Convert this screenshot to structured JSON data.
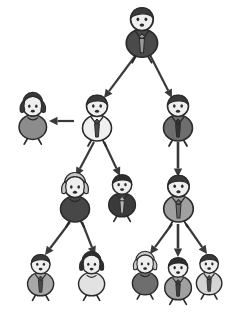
{
  "diagram": {
    "type": "org-chart",
    "background_color": "#ffffff",
    "canvas": {
      "width": 236,
      "height": 318
    },
    "arrow_color": "#3a3a3a",
    "outline_color": "#2b2b2b"
  },
  "palette": {
    "very_dark": "#3b3b3b",
    "dark": "#4a4a4a",
    "mid_dark": "#6e6e6e",
    "mid": "#8c8c8c",
    "mid_light": "#a8a8a8",
    "light": "#c6c6c6",
    "very_light": "#e2e2e2",
    "white": "#f4f4f4",
    "hair_dark": "#3a3a3a",
    "hair_light": "#c9c9c9",
    "skin": "#efefef"
  },
  "nodes": [
    {
      "id": "n1",
      "label": "executive-top",
      "level": 0,
      "gender": "male",
      "x": 142,
      "y": 32,
      "scale": 1.08,
      "body_color": "#4a4a4a",
      "tie_color": "#9a9a9a",
      "hair_color": "#3a3a3a",
      "has_tie": true
    },
    {
      "id": "n2",
      "label": "manager-left",
      "level": 1,
      "gender": "male",
      "x": 97,
      "y": 118,
      "scale": 1.0,
      "body_color": "#f0f0f0",
      "tie_color": "#4a4a4a",
      "hair_color": "#3a3a3a",
      "has_tie": true
    },
    {
      "id": "n3",
      "label": "manager-right",
      "level": 1,
      "gender": "male",
      "x": 178,
      "y": 118,
      "scale": 1.0,
      "body_color": "#6e6e6e",
      "tie_color": "#333333",
      "hair_color": "#3a3a3a",
      "has_tie": true
    },
    {
      "id": "n4",
      "label": "assistant-female-left",
      "level": 1,
      "gender": "female",
      "x": 33,
      "y": 118,
      "scale": 0.95,
      "body_color": "#8c8c8c",
      "tie_color": "#8c8c8c",
      "hair_color": "#3a3a3a",
      "has_tie": false
    },
    {
      "id": "n5",
      "label": "supervisor-female",
      "level": 2,
      "gender": "female",
      "x": 75,
      "y": 199,
      "scale": 1.0,
      "body_color": "#474747",
      "tie_color": "#474747",
      "hair_color": "#c9c9c9",
      "has_tie": false
    },
    {
      "id": "n6",
      "label": "supervisor-male-center",
      "level": 2,
      "gender": "male",
      "x": 122,
      "y": 196,
      "scale": 0.92,
      "body_color": "#3b3b3b",
      "tie_color": "#b5b5b5",
      "hair_color": "#2e2e2e",
      "has_tie": true
    },
    {
      "id": "n7",
      "label": "supervisor-male-right",
      "level": 2,
      "gender": "male",
      "x": 178,
      "y": 199,
      "scale": 1.02,
      "body_color": "#a0a0a0",
      "tie_color": "#6a6a6a",
      "hair_color": "#3a3a3a",
      "has_tie": true
    },
    {
      "id": "n8",
      "label": "staff-male-1",
      "level": 3,
      "gender": "male",
      "x": 41,
      "y": 275,
      "scale": 0.9,
      "body_color": "#a8a8a8",
      "tie_color": "#4a4a4a",
      "hair_color": "#3a3a3a",
      "has_tie": true
    },
    {
      "id": "n9",
      "label": "staff-female-1",
      "level": 3,
      "gender": "female",
      "x": 92,
      "y": 275,
      "scale": 0.9,
      "body_color": "#e2e2e2",
      "tie_color": "#e2e2e2",
      "hair_color": "#2e2e2e",
      "has_tie": false
    },
    {
      "id": "n10",
      "label": "staff-female-2",
      "level": 3,
      "gender": "female",
      "x": 145,
      "y": 275,
      "scale": 0.88,
      "body_color": "#6e6e6e",
      "tie_color": "#6e6e6e",
      "hair_color": "#c9c9c9",
      "has_tie": false
    },
    {
      "id": "n11",
      "label": "staff-male-2",
      "level": 3,
      "gender": "male",
      "x": 178,
      "y": 279,
      "scale": 0.92,
      "body_color": "#a0a0a0",
      "tie_color": "#3f3f3f",
      "hair_color": "#2e2e2e",
      "has_tie": true
    },
    {
      "id": "n12",
      "label": "staff-male-3",
      "level": 3,
      "gender": "male",
      "x": 209,
      "y": 275,
      "scale": 0.88,
      "body_color": "#d4d4d4",
      "tie_color": "#4a4a4a",
      "hair_color": "#3a3a3a",
      "has_tie": true
    }
  ],
  "edges": [
    {
      "id": "e1",
      "label": "top-to-manager-left",
      "from": "n1",
      "to": "n2",
      "x1": 136,
      "y1": 55,
      "x2": 104,
      "y2": 98,
      "style": "diagonal"
    },
    {
      "id": "e2",
      "label": "top-to-manager-right",
      "from": "n1",
      "to": "n3",
      "x1": 150,
      "y1": 55,
      "x2": 172,
      "y2": 98,
      "style": "diagonal"
    },
    {
      "id": "e3",
      "label": "manager-left-to-assistant",
      "from": "n2",
      "to": "n4",
      "x1": 74,
      "y1": 121,
      "x2": 49,
      "y2": 121,
      "style": "horizontal"
    },
    {
      "id": "e4",
      "label": "manager-left-to-supervisor-female",
      "from": "n2",
      "to": "n5",
      "x1": 94,
      "y1": 142,
      "x2": 76,
      "y2": 176,
      "style": "diagonal"
    },
    {
      "id": "e5",
      "label": "manager-left-to-supervisor-male",
      "from": "n2",
      "to": "n6",
      "x1": 104,
      "y1": 142,
      "x2": 120,
      "y2": 176,
      "style": "diagonal"
    },
    {
      "id": "e6",
      "label": "manager-right-to-supervisor-right",
      "from": "n3",
      "to": "n7",
      "x1": 178,
      "y1": 142,
      "x2": 178,
      "y2": 177,
      "style": "vertical"
    },
    {
      "id": "e7",
      "label": "supervisor-female-to-staff-male-1",
      "from": "n5",
      "to": "n8",
      "x1": 70,
      "y1": 222,
      "x2": 45,
      "y2": 255,
      "style": "diagonal"
    },
    {
      "id": "e8",
      "label": "supervisor-female-to-staff-female-1",
      "from": "n5",
      "to": "n9",
      "x1": 82,
      "y1": 222,
      "x2": 95,
      "y2": 255,
      "style": "diagonal"
    },
    {
      "id": "e9",
      "label": "supervisor-right-to-staff-female-2",
      "from": "n7",
      "to": "n10",
      "x1": 172,
      "y1": 224,
      "x2": 150,
      "y2": 254,
      "style": "diagonal"
    },
    {
      "id": "e10",
      "label": "supervisor-right-to-staff-male-2",
      "from": "n7",
      "to": "n11",
      "x1": 178,
      "y1": 224,
      "x2": 178,
      "y2": 257,
      "style": "vertical"
    },
    {
      "id": "e11",
      "label": "supervisor-right-to-staff-male-3",
      "from": "n7",
      "to": "n12",
      "x1": 186,
      "y1": 224,
      "x2": 207,
      "y2": 254,
      "style": "diagonal"
    }
  ]
}
